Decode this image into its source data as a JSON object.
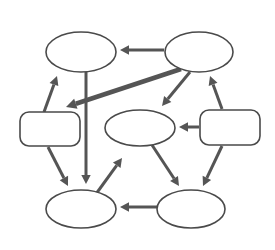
{
  "canvas": {
    "width": 275,
    "height": 250,
    "background_color": "#ffffff",
    "title": "Unlabeled node-and-arrow concept diagram"
  },
  "style": {
    "node_stroke_color": "#4a4a4a",
    "node_fill_color": "#ffffff",
    "node_stroke_width": 1.6,
    "edge_color": "#555555",
    "edge_thin_width": 3,
    "edge_thick_width": 4.5,
    "arrowhead_size": 9
  },
  "diagram": {
    "type": "node-link-graph",
    "node_count": 7,
    "edge_count": 12,
    "nodes": [
      {
        "id": "top-left-ellipse",
        "shape": "ellipse",
        "label": "",
        "cx": 81,
        "cy": 52,
        "rx": 35,
        "ry": 20
      },
      {
        "id": "top-right-ellipse",
        "shape": "ellipse",
        "label": "",
        "cx": 199,
        "cy": 52,
        "rx": 34,
        "ry": 20
      },
      {
        "id": "left-rounded-rect",
        "shape": "rounded-rect",
        "label": "",
        "x": 20,
        "y": 112,
        "width": 60,
        "height": 34,
        "radius": 9
      },
      {
        "id": "center-ellipse",
        "shape": "ellipse",
        "label": "",
        "cx": 140,
        "cy": 128,
        "rx": 35,
        "ry": 18
      },
      {
        "id": "right-rounded-rect",
        "shape": "rounded-rect",
        "label": "",
        "x": 200,
        "y": 110,
        "width": 60,
        "height": 35,
        "radius": 9
      },
      {
        "id": "bottom-left-ellipse",
        "shape": "ellipse",
        "label": "",
        "cx": 81,
        "cy": 209,
        "rx": 35,
        "ry": 19
      },
      {
        "id": "bottom-right-ellipse",
        "shape": "ellipse",
        "label": "",
        "cx": 191,
        "cy": 209,
        "rx": 34,
        "ry": 19
      }
    ],
    "edges": [
      {
        "id": "edge-topright-to-topleft",
        "from": "top-right-ellipse",
        "to": "top-left-ellipse",
        "weight": "thin",
        "x1": 164,
        "y1": 50,
        "x2": 120,
        "y2": 50
      },
      {
        "id": "edge-topright-to-leftrect",
        "from": "top-right-ellipse",
        "to": "left-rounded-rect",
        "weight": "thick",
        "x1": 181,
        "y1": 69,
        "x2": 66,
        "y2": 107
      },
      {
        "id": "edge-topright-to-center",
        "from": "top-right-ellipse",
        "to": "center-ellipse",
        "weight": "thin",
        "x1": 190,
        "y1": 72,
        "x2": 162,
        "y2": 106
      },
      {
        "id": "edge-topleft-to-bottomleft",
        "from": "top-left-ellipse",
        "to": "bottom-left-ellipse",
        "weight": "thin",
        "x1": 86,
        "y1": 72,
        "x2": 86,
        "y2": 184
      },
      {
        "id": "edge-leftrect-to-topleft",
        "from": "left-rounded-rect",
        "to": "top-left-ellipse",
        "weight": "thin",
        "x1": 44,
        "y1": 112,
        "x2": 57,
        "y2": 76
      },
      {
        "id": "edge-leftrect-to-bottomleft",
        "from": "left-rounded-rect",
        "to": "bottom-left-ellipse",
        "weight": "thin",
        "x1": 48,
        "y1": 147,
        "x2": 68,
        "y2": 186
      },
      {
        "id": "edge-rightrect-to-center",
        "from": "right-rounded-rect",
        "to": "center-ellipse",
        "weight": "thin",
        "x1": 199,
        "y1": 127,
        "x2": 179,
        "y2": 127
      },
      {
        "id": "edge-rightrect-to-topright",
        "from": "right-rounded-rect",
        "to": "top-right-ellipse",
        "weight": "thin",
        "x1": 222,
        "y1": 109,
        "x2": 210,
        "y2": 76
      },
      {
        "id": "edge-rightrect-to-bottomright",
        "from": "right-rounded-rect",
        "to": "bottom-right-ellipse",
        "weight": "thin",
        "x1": 222,
        "y1": 146,
        "x2": 203,
        "y2": 186
      },
      {
        "id": "edge-center-to-bottomright",
        "from": "center-ellipse",
        "to": "bottom-right-ellipse",
        "weight": "thin",
        "x1": 152,
        "y1": 145,
        "x2": 179,
        "y2": 186
      },
      {
        "id": "edge-bottomright-to-bottomleft",
        "from": "bottom-right-ellipse",
        "to": "bottom-left-ellipse",
        "weight": "thin",
        "x1": 157,
        "y1": 207,
        "x2": 120,
        "y2": 207
      },
      {
        "id": "edge-bottomarea-to-center-up",
        "from": "bottom-left-ellipse",
        "to": "center-ellipse",
        "weight": "thin",
        "x1": 88,
        "y1": 205,
        "x2": 122,
        "y2": 158
      }
    ]
  }
}
